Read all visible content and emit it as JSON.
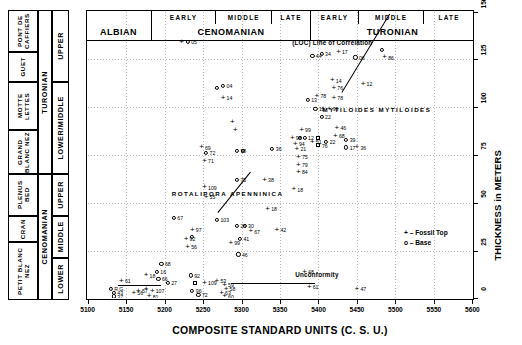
{
  "chart_data": {
    "type": "scatter",
    "title": "",
    "xlabel": "COMPOSITE STANDARD UNITS (C. S. U.)",
    "ylabel": "THICKNESS in METERS",
    "xlim": [
      5100,
      5600
    ],
    "ylim": [
      0,
      150
    ],
    "xticks": [
      5100,
      5150,
      5200,
      5250,
      5300,
      5350,
      5400,
      5450,
      5500,
      5550,
      5600
    ],
    "yticks": [
      0,
      25,
      50,
      75,
      100,
      125,
      150
    ],
    "grid": true,
    "legend_position": "bottom-right",
    "legend": [
      {
        "symbol": "+",
        "label": "Fossil Top"
      },
      {
        "symbol": "o",
        "label": "Base"
      }
    ],
    "series": [
      {
        "name": "Fossil Top",
        "marker": "cross"
      },
      {
        "name": "Base",
        "marker": "circle"
      }
    ],
    "annotations": [
      {
        "text": "(LOC) Line of Correlation",
        "x": 5418,
        "y": 134
      },
      {
        "text": "MYTILOIDES MYTILOIDES",
        "x": 5476,
        "y": 99
      },
      {
        "text": "ROTALIPORA APENNINICA",
        "x": 5282,
        "y": 55
      },
      {
        "text": "Unconformity",
        "x": 5398,
        "y": 13
      }
    ],
    "points": [
      {
        "x": 5222,
        "y": 134,
        "marker": "cross",
        "label": ""
      },
      {
        "x": 5230,
        "y": 134,
        "marker": "circle",
        "label": "05"
      },
      {
        "x": 5268,
        "y": 110,
        "marker": "circle",
        "label": ""
      },
      {
        "x": 5276,
        "y": 111,
        "marker": "circle",
        "label": "04"
      },
      {
        "x": 5276,
        "y": 105,
        "marker": "cross",
        "label": "14"
      },
      {
        "x": 5288,
        "y": 92,
        "marker": "cross",
        "label": ""
      },
      {
        "x": 5292,
        "y": 88,
        "marker": "cross",
        "label": ""
      },
      {
        "x": 5248,
        "y": 79,
        "marker": "cross",
        "label": "69"
      },
      {
        "x": 5254,
        "y": 76,
        "marker": "circle",
        "label": "72"
      },
      {
        "x": 5252,
        "y": 72,
        "marker": "cross",
        "label": "71"
      },
      {
        "x": 5294,
        "y": 77,
        "marker": "circle",
        "label": "98"
      },
      {
        "x": 5302,
        "y": 77,
        "marker": "circle",
        "label": ""
      },
      {
        "x": 5340,
        "y": 78,
        "marker": "circle",
        "label": "36"
      },
      {
        "x": 5294,
        "y": 62,
        "marker": "circle",
        "label": "75"
      },
      {
        "x": 5252,
        "y": 58,
        "marker": "cross",
        "label": "109"
      },
      {
        "x": 5254,
        "y": 53,
        "marker": "cross",
        "label": "55"
      },
      {
        "x": 5330,
        "y": 62,
        "marker": "cross",
        "label": "38"
      },
      {
        "x": 5334,
        "y": 47,
        "marker": "cross",
        "label": "18"
      },
      {
        "x": 5212,
        "y": 42,
        "marker": "circle",
        "label": "67"
      },
      {
        "x": 5236,
        "y": 36,
        "marker": "cross",
        "label": "97"
      },
      {
        "x": 5236,
        "y": 32,
        "marker": "circle",
        "label": ""
      },
      {
        "x": 5268,
        "y": 41,
        "marker": "circle",
        "label": "103"
      },
      {
        "x": 5294,
        "y": 38,
        "marker": "circle",
        "label": "25"
      },
      {
        "x": 5304,
        "y": 38,
        "marker": "circle",
        "label": "30"
      },
      {
        "x": 5312,
        "y": 35,
        "marker": "cross",
        "label": "67"
      },
      {
        "x": 5298,
        "y": 31,
        "marker": "circle",
        "label": "41"
      },
      {
        "x": 5346,
        "y": 36,
        "marker": "cross",
        "label": "42"
      },
      {
        "x": 5296,
        "y": 23,
        "marker": "circle",
        "label": "46"
      },
      {
        "x": 5286,
        "y": 29,
        "marker": "cross",
        "label": "99"
      },
      {
        "x": 5228,
        "y": 31,
        "marker": "cross",
        "label": "92"
      },
      {
        "x": 5230,
        "y": 27,
        "marker": "cross",
        "label": "56"
      },
      {
        "x": 5196,
        "y": 18,
        "marker": "circle",
        "label": "68"
      },
      {
        "x": 5176,
        "y": 12,
        "marker": "cross",
        "label": "18"
      },
      {
        "x": 5190,
        "y": 14,
        "marker": "circle",
        "label": "16"
      },
      {
        "x": 5192,
        "y": 10,
        "marker": "circle",
        "label": "66"
      },
      {
        "x": 5204,
        "y": 8,
        "marker": "circle",
        "label": "27"
      },
      {
        "x": 5234,
        "y": 12,
        "marker": "circle",
        "label": "92"
      },
      {
        "x": 5240,
        "y": 8,
        "marker": "square",
        "label": ""
      },
      {
        "x": 5252,
        "y": 8,
        "marker": "cross",
        "label": "109"
      },
      {
        "x": 5268,
        "y": 9,
        "marker": "cross",
        "label": "53"
      },
      {
        "x": 5278,
        "y": 7,
        "marker": "cross",
        "label": "59"
      },
      {
        "x": 5280,
        "y": 5,
        "marker": "cross",
        "label": "58"
      },
      {
        "x": 5236,
        "y": 4,
        "marker": "circle",
        "label": "96"
      },
      {
        "x": 5244,
        "y": 2,
        "marker": "circle",
        "label": "72"
      },
      {
        "x": 5274,
        "y": 3,
        "marker": "cross",
        "label": "63"
      },
      {
        "x": 5278,
        "y": 1,
        "marker": "cross",
        "label": "60"
      },
      {
        "x": 5144,
        "y": 9,
        "marker": "cross",
        "label": "61"
      },
      {
        "x": 5130,
        "y": 5,
        "marker": "circle",
        "label": "R.G."
      },
      {
        "x": 5134,
        "y": 3,
        "marker": "circle",
        "label": "43"
      },
      {
        "x": 5134,
        "y": 1,
        "marker": "circle",
        "label": "37"
      },
      {
        "x": 5166,
        "y": 4,
        "marker": "cross",
        "label": "57"
      },
      {
        "x": 5176,
        "y": 5,
        "marker": "cross",
        "label": ""
      },
      {
        "x": 5184,
        "y": 4,
        "marker": "cross",
        "label": "107"
      },
      {
        "x": 5180,
        "y": 1,
        "marker": "cross",
        "label": "81"
      },
      {
        "x": 5160,
        "y": 3,
        "marker": "cross",
        "label": "56"
      },
      {
        "x": 5392,
        "y": 127,
        "marker": "circle",
        "label": "44"
      },
      {
        "x": 5404,
        "y": 128,
        "marker": "circle",
        "label": "34"
      },
      {
        "x": 5426,
        "y": 129,
        "marker": "cross",
        "label": "17"
      },
      {
        "x": 5448,
        "y": 126,
        "marker": "circle",
        "label": "06"
      },
      {
        "x": 5482,
        "y": 130,
        "marker": "circle",
        "label": ""
      },
      {
        "x": 5486,
        "y": 126,
        "marker": "cross",
        "label": "86"
      },
      {
        "x": 5458,
        "y": 112,
        "marker": "cross",
        "label": "12"
      },
      {
        "x": 5418,
        "y": 114,
        "marker": "cross",
        "label": "14"
      },
      {
        "x": 5420,
        "y": 110,
        "marker": "cross",
        "label": "76"
      },
      {
        "x": 5420,
        "y": 105,
        "marker": "cross",
        "label": "78"
      },
      {
        "x": 5398,
        "y": 106,
        "marker": "cross",
        "label": "78"
      },
      {
        "x": 5386,
        "y": 104,
        "marker": "circle",
        "label": "13"
      },
      {
        "x": 5396,
        "y": 99,
        "marker": "circle",
        "label": "11"
      },
      {
        "x": 5406,
        "y": 99,
        "marker": "cross",
        "label": ""
      },
      {
        "x": 5414,
        "y": 99,
        "marker": "cross",
        "label": "99"
      },
      {
        "x": 5404,
        "y": 95,
        "marker": "circle",
        "label": "22"
      },
      {
        "x": 5378,
        "y": 88,
        "marker": "cross",
        "label": "99"
      },
      {
        "x": 5366,
        "y": 84,
        "marker": "cross",
        "label": "98"
      },
      {
        "x": 5376,
        "y": 84,
        "marker": "circle",
        "label": ""
      },
      {
        "x": 5382,
        "y": 84,
        "marker": "circle",
        "label": "12"
      },
      {
        "x": 5370,
        "y": 81,
        "marker": "cross",
        "label": "94"
      },
      {
        "x": 5372,
        "y": 78,
        "marker": "cross",
        "label": "21"
      },
      {
        "x": 5392,
        "y": 82,
        "marker": "cross",
        "label": "51"
      },
      {
        "x": 5400,
        "y": 84,
        "marker": "square",
        "label": ""
      },
      {
        "x": 5400,
        "y": 80,
        "marker": "square",
        "label": "76"
      },
      {
        "x": 5410,
        "y": 82,
        "marker": "circle",
        "label": "22"
      },
      {
        "x": 5424,
        "y": 89,
        "marker": "cross",
        "label": "46"
      },
      {
        "x": 5422,
        "y": 85,
        "marker": "cross",
        "label": "68"
      },
      {
        "x": 5436,
        "y": 83,
        "marker": "circle",
        "label": "39"
      },
      {
        "x": 5436,
        "y": 79,
        "marker": "circle",
        "label": "17"
      },
      {
        "x": 5374,
        "y": 74,
        "marker": "cross",
        "label": "75"
      },
      {
        "x": 5374,
        "y": 70,
        "marker": "cross",
        "label": "79"
      },
      {
        "x": 5374,
        "y": 66,
        "marker": "cross",
        "label": "84"
      },
      {
        "x": 5368,
        "y": 57,
        "marker": "cross",
        "label": "18"
      },
      {
        "x": 5450,
        "y": 79,
        "marker": "cross",
        "label": "36"
      },
      {
        "x": 5382,
        "y": 14,
        "marker": "cross",
        "label": "48"
      },
      {
        "x": 5388,
        "y": 6,
        "marker": "cross",
        "label": "61"
      },
      {
        "x": 5450,
        "y": 5,
        "marker": "cross",
        "label": "47"
      }
    ],
    "lines": [
      {
        "name": "line-of-correlation",
        "x1": 5430,
        "y1": 108,
        "x2": 5492,
        "y2": 149
      },
      {
        "name": "apenninica-trend",
        "x1": 5270,
        "y1": 45,
        "x2": 5312,
        "y2": 66
      },
      {
        "name": "unconformity-marker",
        "x1": 5286,
        "y1": 8,
        "x2": 5396,
        "y2": 8
      },
      {
        "name": "basal-marker",
        "x1": 5140,
        "y1": 7,
        "x2": 5196,
        "y2": 7
      }
    ]
  },
  "stage_band": {
    "epochs": [
      {
        "label": "ALBIAN",
        "start": 5100,
        "end": 5185
      },
      {
        "label": "CENOMANIAN",
        "start": 5185,
        "end": 5390
      },
      {
        "label": "TURONIAN",
        "start": 5390,
        "end": 5600
      }
    ],
    "substages": [
      {
        "label": "",
        "start": 5100,
        "end": 5185
      },
      {
        "label": "EARLY",
        "start": 5185,
        "end": 5268
      },
      {
        "label": "MIDDLE",
        "start": 5268,
        "end": 5340
      },
      {
        "label": "LATE",
        "start": 5340,
        "end": 5390
      },
      {
        "label": "EARLY",
        "start": 5390,
        "end": 5452
      },
      {
        "label": "MIDDLE",
        "start": 5452,
        "end": 5536
      },
      {
        "label": "LATE",
        "start": 5536,
        "end": 5600
      }
    ]
  },
  "strat_column": {
    "formations": [
      {
        "label": "PONT DE CAFFIERS",
        "top": 0,
        "height": 42
      },
      {
        "label": "GUET",
        "top": 42,
        "height": 30
      },
      {
        "label": "MOTTE LETTES",
        "top": 72,
        "height": 48
      },
      {
        "label": "GRAND BLANC NEZ",
        "top": 120,
        "height": 44
      },
      {
        "label": "PLENUS BED",
        "top": 164,
        "height": 42
      },
      {
        "label": "CRAN",
        "top": 206,
        "height": 26
      },
      {
        "label": "PETIT BLANC NEZ",
        "top": 232,
        "height": 58
      }
    ],
    "members": [
      {
        "label": "ESCALLES",
        "top": 164,
        "height": 68
      }
    ],
    "stages": [
      {
        "label": "TURONIAN",
        "top": 0,
        "height": 164
      },
      {
        "label": "CENOMANIAN",
        "top": 164,
        "height": 126
      }
    ],
    "substages": [
      {
        "label": "UPPER",
        "top": 0,
        "height": 72
      },
      {
        "label": "LOWER/MIDDLE",
        "top": 72,
        "height": 92
      },
      {
        "label": "UPPER",
        "top": 164,
        "height": 42
      },
      {
        "label": "MIDDLE",
        "top": 206,
        "height": 42
      },
      {
        "label": "LOWER",
        "top": 248,
        "height": 42
      }
    ]
  }
}
